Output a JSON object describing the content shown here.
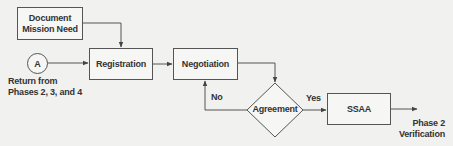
{
  "diagram": {
    "type": "flowchart",
    "nodes": {
      "document": {
        "line1": "Document",
        "line2": "Mission Need"
      },
      "connector": {
        "label": "A",
        "caption_line1": "Return from",
        "caption_line2": "Phases 2, 3, and 4"
      },
      "registration": {
        "label": "Registration"
      },
      "negotiation": {
        "label": "Negotiation"
      },
      "agreement": {
        "label": "Agreement"
      },
      "ssaa": {
        "label": "SSAA"
      },
      "exit": {
        "line1": "Phase 2",
        "line2": "Verification"
      }
    },
    "edges": {
      "no_label": "No",
      "yes_label": "Yes"
    },
    "colors": {
      "background": "#f1f1ef",
      "stroke": "#555555",
      "text": "#333333"
    }
  }
}
